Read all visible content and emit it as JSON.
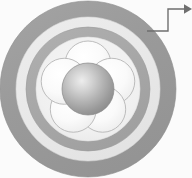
{
  "figure": {
    "title": "Concentric ring cross-section with five-petal rosette core",
    "canvas": {
      "width": 192,
      "height": 178,
      "background": "#fbfbfb"
    },
    "center": {
      "x": 88,
      "y": 89
    },
    "rings": [
      {
        "name": "outer-gray-ring",
        "label": "Outer ring",
        "outer_radius": 88,
        "inner_radius": 72,
        "color": "#9c9c9c",
        "edge_color": "#8d8d8d"
      },
      {
        "name": "light-gap-ring",
        "label": "Light annulus",
        "outer_radius": 72,
        "inner_radius": 62,
        "color": "#e9e9e9",
        "edge_color": "#dcdcdc"
      },
      {
        "name": "inner-gray-ring",
        "label": "Inner ring",
        "outer_radius": 62,
        "inner_radius": 52,
        "color": "#a9a9a9",
        "edge_color": "#9b9b9b"
      },
      {
        "name": "core-disc",
        "label": "Core field",
        "outer_radius": 52,
        "inner_radius": 0,
        "color": "#f1f1f1",
        "edge_color": "#e2e2e2"
      }
    ],
    "petals": {
      "name": "five-petal-rosette",
      "label": "Petals",
      "count": 5,
      "radius": 23,
      "orbit_radius": 25,
      "start_angle_deg": -90,
      "fill": "#f7f7f7",
      "highlight": "#ffffff",
      "stroke": "#b6b6b6",
      "angles_deg": [
        -90,
        -18,
        54,
        126,
        198
      ]
    },
    "core_sphere": {
      "name": "center-sphere",
      "label": "Central sphere",
      "radius": 26,
      "fill_light": "#e6e6e6",
      "fill_mid": "#b4b4b4",
      "fill_dark": "#8e8e8e",
      "highlight_offset": {
        "x": -7,
        "y": -8
      },
      "stroke": "#8a8a8a"
    },
    "callout": {
      "name": "callout-leader",
      "label": "Callout leader arrow",
      "color": "#6f6f6f",
      "stroke_width": 1.4,
      "points": [
        {
          "x": 147,
          "y": 31
        },
        {
          "x": 168,
          "y": 31
        },
        {
          "x": 168,
          "y": 9
        },
        {
          "x": 184,
          "y": 9
        }
      ],
      "arrow_tip": {
        "x": 192,
        "y": 9
      },
      "arrow_size": 8,
      "target_text": ""
    }
  }
}
